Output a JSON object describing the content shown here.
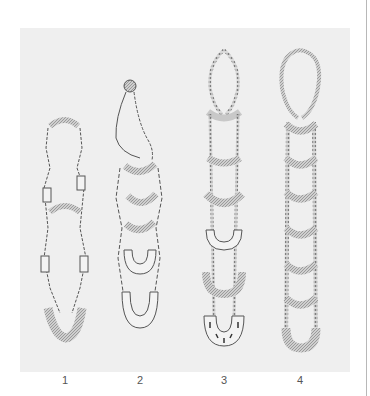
{
  "plate": {
    "background": "#efefef",
    "ink_color": "#555555",
    "figures": [
      {
        "id": "fig-1",
        "label": "1",
        "x": 45
      },
      {
        "id": "fig-2",
        "label": "2",
        "x": 120
      },
      {
        "id": "fig-3",
        "label": "3",
        "x": 204
      },
      {
        "id": "fig-4",
        "label": "4",
        "x": 280
      }
    ]
  }
}
